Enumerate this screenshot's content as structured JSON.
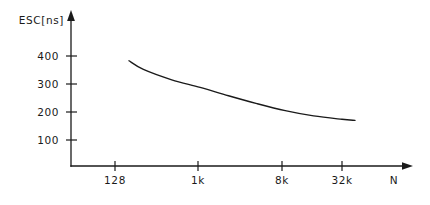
{
  "chart_data": {
    "type": "line",
    "title": "",
    "subtitle": "",
    "ylabel": "ESC[ns]",
    "xlabel": "N",
    "grid": false,
    "legend": false,
    "legend_position": "none",
    "x_scale": "log2",
    "x_tick_labels": [
      "128",
      "1k",
      "8k",
      "32k"
    ],
    "x_tick_values": [
      128,
      1024,
      8192,
      32768
    ],
    "y_tick_labels": [
      "400",
      "300",
      "200",
      "100"
    ],
    "y_tick_values": [
      400,
      300,
      200,
      100
    ],
    "ylim": [
      0,
      450
    ],
    "xlim": [
      64,
      65536
    ],
    "series": [
      {
        "name": "ESC",
        "x": [
          180,
          256,
          512,
          1024,
          2048,
          4096,
          8192,
          16384,
          32768,
          45000
        ],
        "values": [
          383,
          352,
          315,
          288,
          258,
          230,
          205,
          186,
          174,
          170
        ]
      }
    ],
    "annotations": [],
    "axis_arrows": true,
    "axis_color": "#1a1a1a",
    "curve_color": "#1a1a1a",
    "background_color": "#ffffff"
  },
  "figure": {
    "y_axis_name": "y-axis",
    "x_axis_name": "x-axis",
    "curve_name": "esc-curve"
  }
}
